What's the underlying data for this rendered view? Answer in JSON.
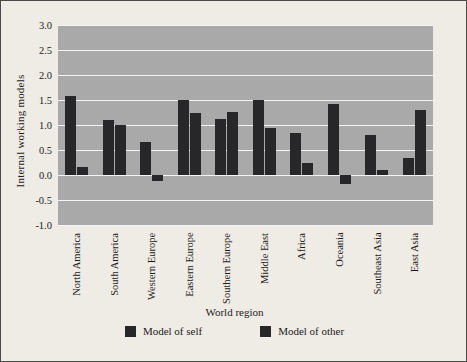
{
  "chart_data": {
    "type": "bar",
    "title": "",
    "xlabel": "World region",
    "ylabel": "Internal working models",
    "categories": [
      "North America",
      "South America",
      "Western Europe",
      "Eastern Europe",
      "Southern Europe",
      "Middle East",
      "Africa",
      "Oceania",
      "Southeast Asia",
      "East Asia"
    ],
    "series": [
      {
        "name": "Model of self",
        "color": "#27272a",
        "values": [
          1.58,
          1.1,
          0.66,
          1.51,
          1.12,
          1.5,
          0.85,
          1.42,
          0.8,
          0.35
        ]
      },
      {
        "name": "Model of other",
        "color": "#27272a",
        "values": [
          0.17,
          1.01,
          -0.12,
          1.25,
          1.27,
          0.95,
          0.25,
          -0.17,
          0.1,
          1.3
        ]
      }
    ],
    "ylim": [
      -1.0,
      3.0
    ],
    "yticks": [
      3.0,
      2.5,
      2.0,
      1.5,
      1.0,
      0.5,
      0.0,
      -0.5,
      -1.0
    ],
    "ytick_labels": [
      "3.0",
      "2.5",
      "2.0",
      "1.5",
      "1.0",
      "0.5",
      "0.0",
      "-0.5",
      "-1.0"
    ],
    "grid": true,
    "legend_position": "bottom",
    "plot_background": "#a9a9a9",
    "figure_background": "#efebe5",
    "gridline_color": "#f4f4f4"
  },
  "legend": {
    "items": [
      {
        "label": "Model of self"
      },
      {
        "label": "Model of other"
      }
    ]
  }
}
